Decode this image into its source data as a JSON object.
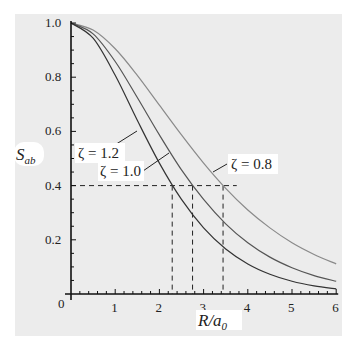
{
  "chart_data": {
    "type": "line",
    "title": "",
    "xlabel": "R/a0",
    "ylabel": "S_ab",
    "xlim": [
      0,
      6
    ],
    "ylim": [
      0,
      1.0
    ],
    "grid": false,
    "legend": "inline annotations",
    "x_ticks": [
      "0",
      "1",
      "2",
      "3",
      "4",
      "5",
      "6"
    ],
    "y_ticks": [
      "0.2",
      "0.4",
      "0.6",
      "0.8",
      "1.0"
    ],
    "x": [
      0,
      0.5,
      1.0,
      1.5,
      2.0,
      2.5,
      3.0,
      3.5,
      4.0,
      4.5,
      5.0,
      5.5,
      6.0
    ],
    "series": [
      {
        "name": "ζ = 0.8",
        "color": "#8a8a8a",
        "values": [
          1.0,
          0.974,
          0.905,
          0.807,
          0.697,
          0.587,
          0.483,
          0.39,
          0.31,
          0.244,
          0.189,
          0.146,
          0.111
        ]
      },
      {
        "name": "ζ = 1.0",
        "color": "#555555",
        "values": [
          1.0,
          0.96,
          0.858,
          0.725,
          0.587,
          0.458,
          0.349,
          0.259,
          0.189,
          0.136,
          0.097,
          0.068,
          0.047
        ]
      },
      {
        "name": "ζ = 1.2",
        "color": "#333333",
        "values": [
          1.0,
          0.944,
          0.807,
          0.641,
          0.483,
          0.349,
          0.244,
          0.166,
          0.111,
          0.073,
          0.047,
          0.03,
          0.019
        ]
      }
    ],
    "annotations": [
      {
        "text": "ζ = 1.2",
        "series": "ζ = 1.2"
      },
      {
        "text": "ζ = 1.0",
        "series": "ζ = 1.0"
      },
      {
        "text": "ζ = 0.8",
        "series": "ζ = 0.8"
      }
    ],
    "reference_lines": {
      "horizontal_y": 0.4,
      "vertical_x": [
        2.29,
        2.75,
        3.44
      ]
    }
  },
  "labels": {
    "y_axis": "S",
    "y_axis_sub": "ab",
    "x_axis_R": "R/a",
    "x_axis_sub": "0",
    "origin": "0"
  }
}
